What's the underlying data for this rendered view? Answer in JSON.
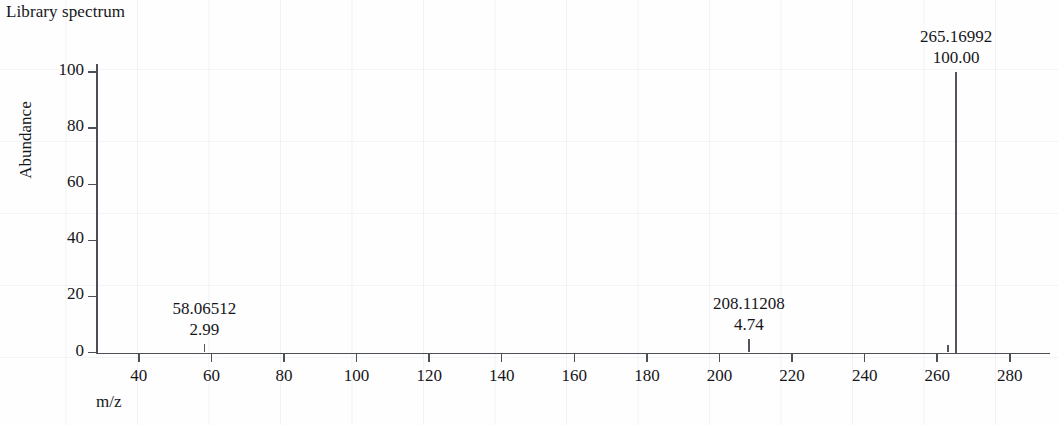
{
  "chart_title": "Library spectrum",
  "axes": {
    "y_title": "Abundance",
    "x_title": "m/z",
    "y_ticks": [
      "0",
      "20",
      "40",
      "60",
      "80",
      "100"
    ],
    "x_ticks": [
      "40",
      "60",
      "80",
      "100",
      "120",
      "140",
      "160",
      "180",
      "200",
      "220",
      "240",
      "260",
      "280"
    ]
  },
  "colors": {
    "axis": "#4c4f55",
    "peak": "#52555b",
    "text": "#16161a",
    "background": "#fefefe"
  },
  "chart_data": {
    "type": "bar",
    "title": "Library spectrum",
    "xlabel": "m/z",
    "ylabel": "Abundance",
    "xlim": [
      28,
      292
    ],
    "ylim": [
      0,
      108
    ],
    "grid": false,
    "legend": "none",
    "x": [
      58.06512,
      208.11208,
      262.9,
      265.16992
    ],
    "values": [
      2.99,
      4.74,
      2.6,
      100.0
    ],
    "categories": [
      "58.06512",
      "208.11208",
      "262.9",
      "265.16992"
    ],
    "labels": [
      {
        "mz": "58.06512",
        "abundance": "2.99",
        "labeled": true
      },
      {
        "mz": "208.11208",
        "abundance": "4.74",
        "labeled": true
      },
      {
        "mz": "265.16992",
        "abundance": "100.00",
        "labeled": true
      }
    ],
    "base_peak": {
      "mz": "265.16992",
      "abundance": "100.00"
    }
  }
}
